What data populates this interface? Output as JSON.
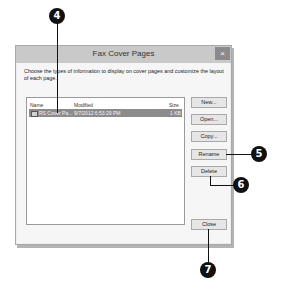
{
  "dialog": {
    "title": "Fax Cover Pages",
    "close_glyph": "×",
    "description": "Choose the types of information to display on cover pages and customize the layout of each page.",
    "list": {
      "columns": [
        "Name",
        "Modified",
        "Size"
      ],
      "rows": [
        {
          "name": "RS Cover Pa...",
          "modified": "9/7/2012 6:53:29 PM",
          "size": "1 KB",
          "selected": true
        }
      ]
    },
    "buttons": {
      "new": "New...",
      "open": "Open...",
      "copy": "Copy...",
      "rename": "Rename",
      "delete": "Delete",
      "close": "Close"
    }
  },
  "callouts": [
    "4",
    "5",
    "6",
    "7"
  ]
}
